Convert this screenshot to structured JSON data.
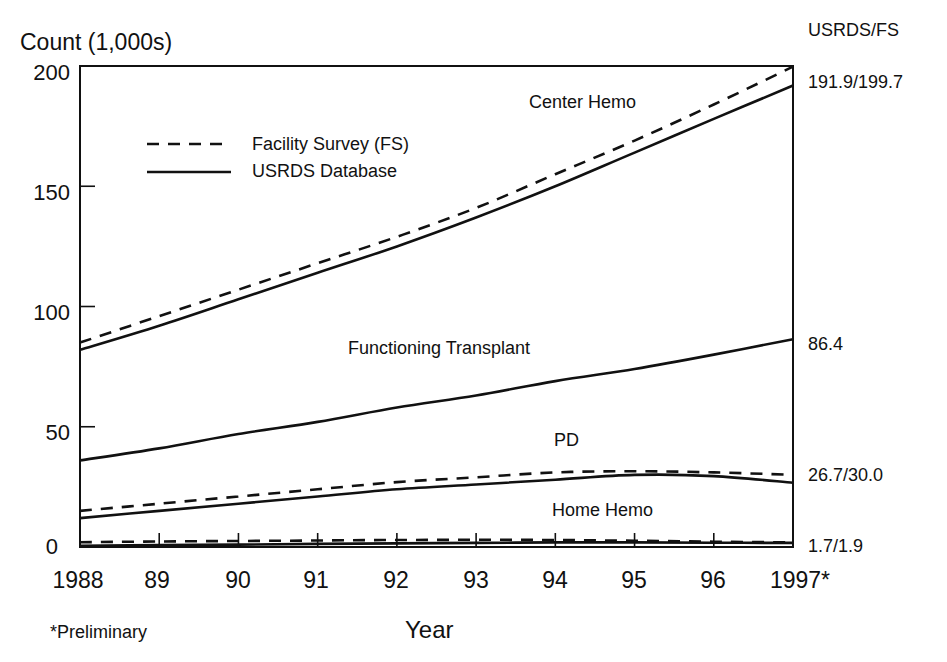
{
  "chart_data": {
    "type": "line",
    "title": "",
    "ylabel": "Count (1,000s)",
    "xlabel": "Year",
    "footnote": "*Preliminary",
    "right_header": "USRDS/FS",
    "ylim": [
      0,
      200
    ],
    "yticks": [
      "0",
      "50",
      "100",
      "150",
      "200"
    ],
    "x": [
      1988,
      1989,
      1990,
      1991,
      1992,
      1993,
      1994,
      1995,
      1996,
      1997
    ],
    "xtick_labels": [
      "1988",
      "89",
      "90",
      "91",
      "92",
      "93",
      "94",
      "95",
      "96",
      "1997*"
    ],
    "grid": false,
    "legend": {
      "position": "upper-left",
      "entries": [
        {
          "label": "Facility Survey (FS)",
          "style": "dashed"
        },
        {
          "label": "USRDS Database",
          "style": "solid"
        }
      ]
    },
    "series": [
      {
        "name": "Center Hemo - USRDS",
        "group": "Center Hemo",
        "source": "USRDS",
        "style": "solid",
        "values": [
          82,
          92,
          103,
          114,
          125,
          137,
          150,
          164,
          178,
          191.9
        ]
      },
      {
        "name": "Center Hemo - FS",
        "group": "Center Hemo",
        "source": "FS",
        "style": "dashed",
        "values": [
          85,
          96,
          107,
          118,
          129,
          141,
          155,
          169,
          184,
          199.7
        ]
      },
      {
        "name": "Functioning Transplant - USRDS",
        "group": "Functioning Transplant",
        "source": "USRDS",
        "style": "solid",
        "values": [
          36,
          41,
          47,
          52,
          58,
          63,
          69,
          74,
          80,
          86.4
        ]
      },
      {
        "name": "PD - USRDS",
        "group": "PD",
        "source": "USRDS",
        "style": "solid",
        "values": [
          12,
          15,
          18,
          21,
          24,
          26,
          28,
          30,
          29.5,
          26.7
        ]
      },
      {
        "name": "PD - FS",
        "group": "PD",
        "source": "FS",
        "style": "dashed",
        "values": [
          15,
          18,
          21,
          24,
          27,
          29,
          31,
          31.5,
          31,
          30.0
        ]
      },
      {
        "name": "Home Hemo - USRDS",
        "group": "Home Hemo",
        "source": "USRDS",
        "style": "solid",
        "values": [
          0.5,
          0.8,
          1.0,
          1.3,
          1.5,
          1.7,
          1.9,
          1.9,
          1.8,
          1.7
        ]
      },
      {
        "name": "Home Hemo - FS",
        "group": "Home Hemo",
        "source": "FS",
        "style": "dashed",
        "values": [
          2.0,
          2.3,
          2.5,
          2.7,
          2.9,
          3.0,
          2.9,
          2.6,
          2.2,
          1.9
        ]
      }
    ],
    "annotations": [
      {
        "text": "Center Hemo",
        "series_group": "Center Hemo"
      },
      {
        "text": "Functioning Transplant",
        "series_group": "Functioning Transplant"
      },
      {
        "text": "PD",
        "series_group": "PD"
      },
      {
        "text": "Home Hemo",
        "series_group": "Home Hemo"
      }
    ],
    "end_labels": [
      {
        "text": "191.9/199.7",
        "series_group": "Center Hemo"
      },
      {
        "text": "86.4",
        "series_group": "Functioning Transplant"
      },
      {
        "text": "26.7/30.0",
        "series_group": "PD"
      },
      {
        "text": "1.7/1.9",
        "series_group": "Home Hemo"
      }
    ]
  }
}
